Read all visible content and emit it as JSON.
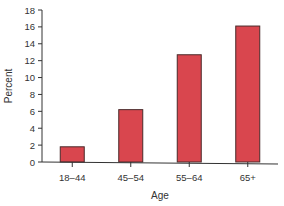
{
  "chart_data": {
    "type": "bar",
    "title": "",
    "xlabel": "Age",
    "ylabel": "Percent",
    "categories": [
      "18–44",
      "45–54",
      "55–64",
      "65+"
    ],
    "values": [
      1.8,
      6.2,
      12.7,
      16.1
    ],
    "ylim": [
      0,
      18
    ],
    "yticks": [
      0,
      2,
      4,
      6,
      8,
      10,
      12,
      14,
      16,
      18
    ],
    "grid": false,
    "legend": null,
    "bar_color": "#d9464e",
    "bar_edge_color": "#4a2a2a"
  }
}
